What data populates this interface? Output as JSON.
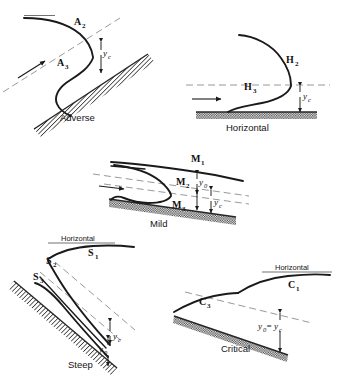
{
  "figure": {
    "background_color": "#ffffff",
    "ink_color": "#1a1a1a",
    "guide_color": "#8c8c8c",
    "panels": [
      {
        "key": "adverse",
        "name": "Adverse",
        "caption": "Adverse",
        "slope_type": "adverse",
        "profiles": [
          {
            "label": "A",
            "subscript": "2",
            "full": "A2"
          },
          {
            "label": "A",
            "subscript": "3",
            "full": "A3"
          }
        ],
        "depth_labels": [
          {
            "symbol": "y",
            "subscript": "c",
            "full": "yc"
          }
        ],
        "has_flow_arrow": true,
        "has_critical_dash_line": true
      },
      {
        "key": "horizontal",
        "name": "Horizontal",
        "caption": "Horizontal",
        "slope_type": "horizontal",
        "profiles": [
          {
            "label": "H",
            "subscript": "2",
            "full": "H2"
          },
          {
            "label": "H",
            "subscript": "3",
            "full": "H3"
          }
        ],
        "depth_labels": [
          {
            "symbol": "y",
            "subscript": "c",
            "full": "yc"
          }
        ],
        "has_flow_arrow": true,
        "has_critical_dash_line": true
      },
      {
        "key": "mild",
        "name": "Mild",
        "caption": "Mild",
        "slope_type": "mild",
        "profiles": [
          {
            "label": "M",
            "subscript": "1",
            "full": "M1"
          },
          {
            "label": "M",
            "subscript": "2",
            "full": "M2"
          },
          {
            "label": "M",
            "subscript": "3",
            "full": "M3"
          }
        ],
        "depth_labels": [
          {
            "symbol": "y",
            "subscript": "0",
            "full": "y0"
          },
          {
            "symbol": "y",
            "subscript": "c",
            "full": "yc"
          }
        ],
        "has_flow_arrow": true,
        "has_critical_dash_line": true
      },
      {
        "key": "steep",
        "name": "Steep",
        "caption": "Steep",
        "slope_type": "steep",
        "horizontal_label": "Horizontal",
        "profiles": [
          {
            "label": "S",
            "subscript": "1",
            "full": "S1"
          },
          {
            "label": "S",
            "subscript": "2",
            "full": "S2"
          },
          {
            "label": "S",
            "subscript": "3",
            "full": "S3"
          }
        ],
        "depth_labels": [
          {
            "symbol": "y",
            "subscript": "c",
            "full": "yc"
          },
          {
            "symbol": "y",
            "subscript": "0",
            "full": "y0"
          }
        ],
        "has_flow_arrow": false,
        "has_critical_dash_line": true
      },
      {
        "key": "critical",
        "name": "Critical",
        "caption": "Critical",
        "slope_type": "critical",
        "horizontal_label": "Horizontal",
        "profiles": [
          {
            "label": "C",
            "subscript": "1",
            "full": "C1"
          },
          {
            "label": "C",
            "subscript": "3",
            "full": "C3"
          }
        ],
        "depth_labels": [
          {
            "symbol": "y",
            "subscript": "0",
            "full": "y0"
          },
          {
            "symbol": "=",
            "subscript": "",
            "full": "="
          },
          {
            "symbol": "y",
            "subscript": "c",
            "full": "yc"
          }
        ],
        "equality_text": "y0 = yc",
        "has_flow_arrow": false,
        "has_critical_dash_line": true
      }
    ]
  }
}
